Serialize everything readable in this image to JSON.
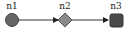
{
  "diagram": {
    "nodes": [
      {
        "id": "n1",
        "label": "n1",
        "shape": "circle",
        "fill": "#666666",
        "stroke": "#444444"
      },
      {
        "id": "n2",
        "label": "n2",
        "shape": "diamond",
        "fill": "#8a8a8a",
        "stroke": "#555555"
      },
      {
        "id": "n3",
        "label": "n3",
        "shape": "rounded-square",
        "fill": "#4a4a4a",
        "stroke": "#333333"
      }
    ],
    "edges": [
      {
        "from": "n1",
        "to": "n2",
        "arrow": "filled"
      },
      {
        "from": "n2",
        "to": "n3",
        "arrow": "filled"
      }
    ],
    "edge_color": "#333333"
  }
}
